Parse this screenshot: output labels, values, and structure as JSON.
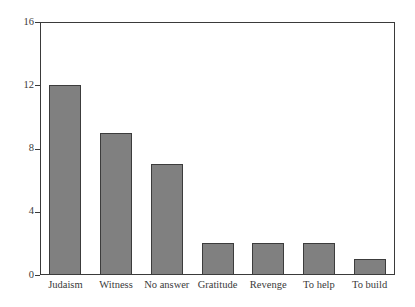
{
  "chart_data": {
    "type": "bar",
    "title": "",
    "subtitle": "",
    "xlabel": "",
    "ylabel": "",
    "categories": [
      "Judaism",
      "Witness",
      "No answer",
      "Gratitude",
      "Revenge",
      "To help",
      "To build"
    ],
    "values": [
      12,
      9,
      7,
      2,
      2,
      2,
      1
    ],
    "ylim": [
      0,
      16
    ],
    "yticks": [
      0,
      4,
      8,
      12,
      16
    ],
    "ytick_labels": [
      "0",
      "4",
      "8",
      "12",
      "16"
    ],
    "grid": false,
    "legend": null,
    "legend_position": "none",
    "bar_fill_color": "#808080",
    "bar_border_color": "#3c3c3c",
    "axis_color": "#3a3a3a",
    "background_color": "#ffffff"
  }
}
